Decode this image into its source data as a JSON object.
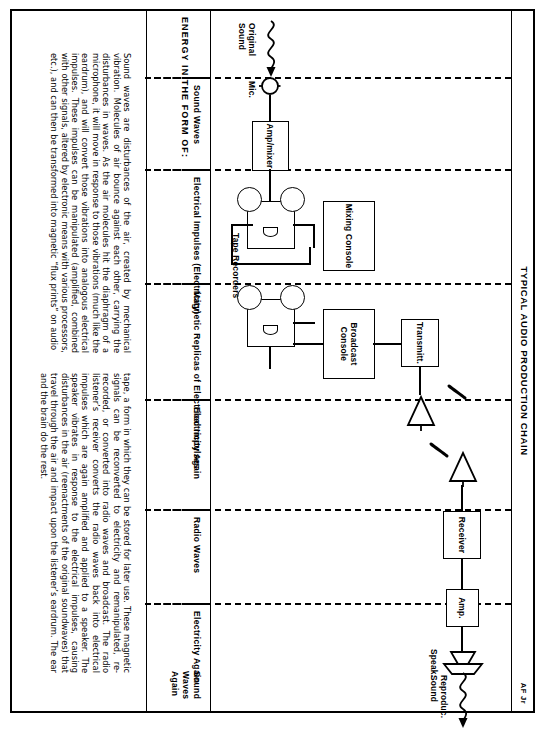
{
  "sheet": {
    "title": "TYPICAL AUDIO PRODUCTION CHAIN",
    "signature": "AF Jr",
    "energy_header": "ENERGY IN THE FORM OF:"
  },
  "diagram": {
    "nodes": [
      {
        "id": "original-sound",
        "label": "Original\nSound",
        "kind": "wavy-arrow"
      },
      {
        "id": "microphone",
        "label": "Mic.",
        "kind": "mic-circle"
      },
      {
        "id": "amp-mixer",
        "label": "Amp/mixer",
        "kind": "box"
      },
      {
        "id": "tape-recorders",
        "label": "Tape  Recorders",
        "kind": "reel-deck-pair"
      },
      {
        "id": "mixing-console",
        "label": "Mixing\nConsole",
        "kind": "box"
      },
      {
        "id": "broadcast-console",
        "label": "Broadcast\nConsole",
        "kind": "box"
      },
      {
        "id": "transmitter",
        "label": "Transmitt.",
        "kind": "box"
      },
      {
        "id": "transmit-antenna",
        "label": "",
        "kind": "antenna"
      },
      {
        "id": "receive-antenna",
        "label": "",
        "kind": "antenna"
      },
      {
        "id": "receiver",
        "label": "Receiver",
        "kind": "box"
      },
      {
        "id": "amplifier",
        "label": "Amp.",
        "kind": "box"
      },
      {
        "id": "speaker",
        "label": "Speak.",
        "kind": "horn"
      },
      {
        "id": "reproduced-sound",
        "label": "Reproduc.\nSound",
        "kind": "wavy-arrow"
      }
    ]
  },
  "energy": {
    "cells": [
      {
        "id": "sound-waves",
        "label": "Sound\nWaves"
      },
      {
        "id": "electrical-impulses",
        "label": "Electrical Impulses\n(Electricity)"
      },
      {
        "id": "magnetic-replicas",
        "label": "Magnetic Replicas\nof Electrical\nImpulses"
      },
      {
        "id": "electricity-again",
        "label": "Electricity Again"
      },
      {
        "id": "radio-waves",
        "label": "Radio  Waves"
      },
      {
        "id": "electricity-again-2",
        "label": "Electricity\nAgain"
      },
      {
        "id": "sound-waves-again",
        "label": "Sound\nWaves\nAgain"
      }
    ]
  },
  "body": {
    "paragraph_1": "Sound waves are disturbances of the air, created by mechanical vibration. Molecules of air bounce against each other, carrying the disturbances in waves. As the air molecules hit the diaphragm of a microphone, it will move in response to those vibrations (much like the eardrum), and will convert those vibrations into analogous electrical impulses. These impulses can be manipulated (amplified, combined with other signals, altered by electronic means with various processors, etc.), and can then be transformed into magnetic “flux prints” on audio",
    "paragraph_2": "tape, a form in which they can be stored for later use. These magnetic signals can be reconverted to electricity and remanipulated, re-recorded, or converted into radio waves and broadcast. The radio listener’s receiver converts the radio waves back into electrical impulses which are again amplified and applied to a speaker. The speaker vibrates in response to the electrical impulses, causing disturbances in the air (reenactments of the original soundwaves) that travel through the air and impact upon the listener’s eardrum. The ear and the brain do the rest."
  }
}
